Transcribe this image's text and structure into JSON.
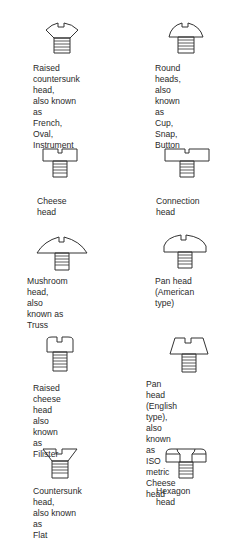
{
  "diagram": {
    "items": [
      {
        "id": "raised-countersunk",
        "label": "Raised\ncountersunk\nhead,\nalso known as\nFrench, Oval,\nInstrument"
      },
      {
        "id": "round",
        "label": "Round heads,\nalso known as\nCup, Snap,\nButton"
      },
      {
        "id": "cheese",
        "label": "Cheese head"
      },
      {
        "id": "connection",
        "label": "Connection head"
      },
      {
        "id": "mushroom",
        "label": "Mushroom head,\nalso known as\nTruss"
      },
      {
        "id": "pan-american",
        "label": "Pan head\n(American type)"
      },
      {
        "id": "raised-cheese",
        "label": "Raised cheese\nhead\nalso known as\nFilister"
      },
      {
        "id": "pan-english",
        "label": "Pan head\n(English type), also\nknown as\nISO metric\nCheese head"
      },
      {
        "id": "countersunk",
        "label": "Countersunk\nhead,\nalso known as\nFlat"
      },
      {
        "id": "hexagon",
        "label": "Hexagon head"
      }
    ]
  }
}
